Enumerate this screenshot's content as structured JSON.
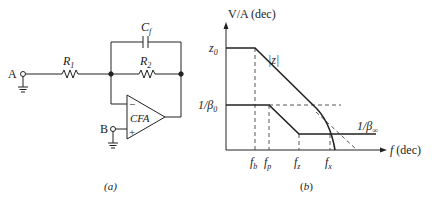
{
  "colors": {
    "ink": "#222222",
    "dash": "#444444",
    "background": "#ffffff"
  },
  "circuit": {
    "caption": "(a)",
    "node_a": "A",
    "node_b": "B",
    "r1": {
      "main": "R",
      "sub": "1"
    },
    "r2": {
      "main": "R",
      "sub": "2"
    },
    "cf": {
      "main": "C",
      "sub": "f"
    },
    "amp_label": "CFA",
    "minus": "−",
    "plus": "+"
  },
  "bode": {
    "caption": "(b)",
    "y_axis_label": "V/A (dec)",
    "x_axis_label_f": "f",
    "x_axis_label_unit": "(dec)",
    "z0": {
      "main": "z",
      "sub": "0"
    },
    "inv_beta0": {
      "main": "1/β",
      "sub": "0"
    },
    "inv_beta_inf": {
      "main": "1/β",
      "sub": "∞"
    },
    "z_mag": "|z|",
    "ticks": [
      {
        "main": "f",
        "sub": "b"
      },
      {
        "main": "f",
        "sub": "p"
      },
      {
        "main": "f",
        "sub": "z"
      },
      {
        "main": "f",
        "sub": "x"
      }
    ]
  }
}
